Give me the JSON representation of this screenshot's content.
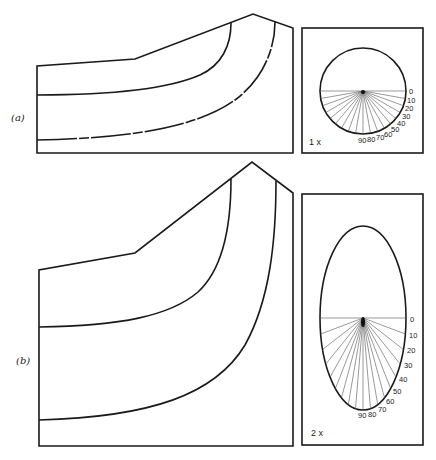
{
  "panels": [
    {
      "id": "a",
      "label": "(a)",
      "scale_label": "1 x",
      "indicatrix": "circle",
      "angle_labels": [
        "0",
        "10",
        "20",
        "30",
        "40",
        "50",
        "60",
        "70",
        "80",
        "90"
      ]
    },
    {
      "id": "b",
      "label": "(b)",
      "scale_label": "2 x",
      "indicatrix": "ellipse",
      "angle_labels": [
        "0",
        "10",
        "20",
        "30",
        "40",
        "50",
        "60",
        "70",
        "80",
        "90"
      ]
    }
  ],
  "colors": {
    "line": "#1a1a1a",
    "background": "#ffffff"
  }
}
